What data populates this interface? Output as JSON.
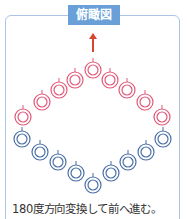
{
  "title": "俯瞰図",
  "caption": "180度方向変換して前へ進む。",
  "colors": {
    "frame": "#a9c6e6",
    "title_bg": "#6a9fd8",
    "arrow": "#d9452e",
    "red": "#e05a7a",
    "blue": "#4a6fa5"
  },
  "arrow": {
    "x": 93,
    "y1": 52,
    "y2": 33
  },
  "red_circles": [
    [
      23,
      117
    ],
    [
      42,
      102
    ],
    [
      59,
      90
    ],
    [
      75,
      80
    ],
    [
      93,
      70
    ],
    [
      110,
      80
    ],
    [
      127,
      90
    ],
    [
      145,
      102
    ],
    [
      162,
      117
    ]
  ],
  "blue_circles": [
    [
      22,
      139
    ],
    [
      40,
      152
    ],
    [
      58,
      162
    ],
    [
      76,
      173
    ],
    [
      93,
      185
    ],
    [
      111,
      173
    ],
    [
      128,
      162
    ],
    [
      146,
      152
    ],
    [
      163,
      139
    ]
  ]
}
